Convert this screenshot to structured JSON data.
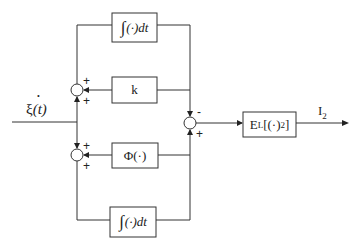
{
  "input": {
    "label": "ξ(t)",
    "symbol": "ξ",
    "arg": "(t)",
    "dot": "•"
  },
  "blocks": {
    "integrator_top": {
      "integral": "∫",
      "body": "(·)dt"
    },
    "gain": {
      "label": "k"
    },
    "nonlinearity": {
      "label": "Φ(·)"
    },
    "integrator_bottom": {
      "integral": "∫",
      "body": "(·)dt"
    },
    "expectation": {
      "main": "E",
      "sub": "L",
      "body": "[(·)",
      "sup": "2",
      "close": "]"
    }
  },
  "summers": {
    "upper": {
      "sign_top": "+",
      "sign_bottom": "+"
    },
    "lower": {
      "sign_top": "+",
      "sign_bottom": "+"
    },
    "output": {
      "sign_top": "-",
      "sign_bottom": "+"
    }
  },
  "output": {
    "main": "I",
    "sub": "2"
  }
}
